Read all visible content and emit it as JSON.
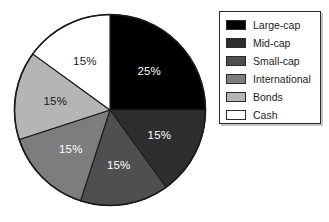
{
  "chart_data": {
    "type": "pie",
    "title": "",
    "subtitle": "",
    "xlabel": "",
    "ylabel": "",
    "grid": false,
    "legend_position": "right",
    "start_angle_deg": 0,
    "direction": "clockwise",
    "categories": [
      "Large-cap",
      "Mid-cap",
      "Small-cap",
      "International",
      "Bonds",
      "Cash"
    ],
    "values": [
      25,
      15,
      15,
      15,
      15,
      15
    ],
    "value_unit": "%",
    "slices": [
      {
        "label": "Large-cap",
        "value": 25,
        "data_label": "25%",
        "color": "#000000",
        "label_color": "#ffffff",
        "start_deg": 0,
        "end_deg": 90,
        "label_r": 0.58,
        "label_mid_deg": 45
      },
      {
        "label": "Mid-cap",
        "value": 15,
        "data_label": "15%",
        "color": "#2e2e2e",
        "label_color": "#ffffff",
        "start_deg": 90,
        "end_deg": 144,
        "label_r": 0.58,
        "label_mid_deg": 117
      },
      {
        "label": "Small-cap",
        "value": 15,
        "data_label": "15%",
        "color": "#4f4f4f",
        "label_color": "#ffffff",
        "start_deg": 144,
        "end_deg": 198,
        "label_r": 0.58,
        "label_mid_deg": 171
      },
      {
        "label": "International",
        "value": 15,
        "data_label": "15%",
        "color": "#7d7d7d",
        "label_color": "#ffffff",
        "start_deg": 198,
        "end_deg": 252,
        "label_r": 0.58,
        "label_mid_deg": 225
      },
      {
        "label": "Bonds",
        "value": 15,
        "data_label": "15%",
        "color": "#b5b5b5",
        "label_color": "#1a1a1a",
        "start_deg": 252,
        "end_deg": 306,
        "label_r": 0.58,
        "label_mid_deg": 279
      },
      {
        "label": "Cash",
        "value": 15,
        "data_label": "15%",
        "color": "#ffffff",
        "label_color": "#1a1a1a",
        "start_deg": 306,
        "end_deg": 360,
        "label_r": 0.58,
        "label_mid_deg": 333
      }
    ],
    "outline_color": "#1a1a1a"
  },
  "legend": {
    "items": [
      {
        "label": "Large-cap",
        "color": "#000000"
      },
      {
        "label": "Mid-cap",
        "color": "#2e2e2e"
      },
      {
        "label": "Small-cap",
        "color": "#4f4f4f"
      },
      {
        "label": "International",
        "color": "#7d7d7d"
      },
      {
        "label": "Bonds",
        "color": "#b5b5b5"
      },
      {
        "label": "Cash",
        "color": "#ffffff"
      }
    ],
    "border_color": "#2b2b2b"
  }
}
